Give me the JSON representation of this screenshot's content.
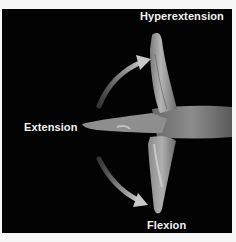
{
  "figure": {
    "labels": {
      "hyperextension": "Hyperextension",
      "extension": "Extension",
      "flexion": "Flexion"
    },
    "background_color": "#030303",
    "page_color": "#f7f7f7",
    "label_color": "#f2f2f2",
    "arrows": [
      {
        "name": "arrow-to-hyperextension",
        "direction": "up-right"
      },
      {
        "name": "arrow-to-flexion",
        "direction": "down-right"
      }
    ]
  }
}
